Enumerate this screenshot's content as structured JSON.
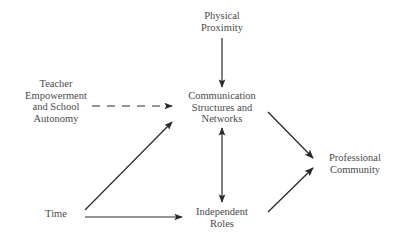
{
  "diagram": {
    "nodes": {
      "physical_proximity": {
        "lines": [
          "Physical",
          "Proximity"
        ]
      },
      "teacher_empowerment": {
        "lines": [
          "Teacher",
          "Empowerment",
          "and School",
          "Autonomy"
        ]
      },
      "communication": {
        "lines": [
          "Communication",
          "Structures and",
          "Networks"
        ]
      },
      "professional_community": {
        "lines": [
          "Professional",
          "Community"
        ]
      },
      "time": {
        "lines": [
          "Time"
        ]
      },
      "independent_roles": {
        "lines": [
          "Independent",
          "Roles"
        ]
      }
    },
    "edges": [
      {
        "from": "Physical Proximity",
        "to": "Communication Structures and Networks",
        "style": "solid",
        "direction": "forward"
      },
      {
        "from": "Teacher Empowerment and School Autonomy",
        "to": "Communication Structures and Networks",
        "style": "dashed",
        "direction": "forward"
      },
      {
        "from": "Time",
        "to": "Communication Structures and Networks",
        "style": "solid",
        "direction": "forward"
      },
      {
        "from": "Time",
        "to": "Independent Roles",
        "style": "solid",
        "direction": "forward"
      },
      {
        "from": "Communication Structures and Networks",
        "to": "Independent Roles",
        "style": "solid",
        "direction": "both"
      },
      {
        "from": "Communication Structures and Networks",
        "to": "Professional Community",
        "style": "solid",
        "direction": "forward"
      },
      {
        "from": "Independent Roles",
        "to": "Professional Community",
        "style": "solid",
        "direction": "forward"
      }
    ],
    "colors": {
      "line": "#2a2a2a",
      "text": "#4a4a4a",
      "background": "#ffffff"
    }
  }
}
